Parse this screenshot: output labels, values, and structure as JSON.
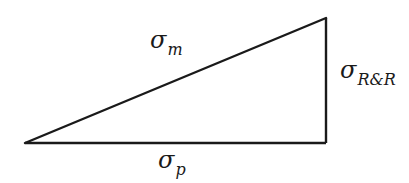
{
  "diagram": {
    "type": "right-triangle",
    "colors": {
      "stroke": "#1a1a1a",
      "background": "#ffffff"
    },
    "vertices": {
      "left": [
        25,
        143
      ],
      "top_right": [
        326,
        18
      ],
      "bottom_right": [
        326,
        143
      ]
    },
    "edges": [
      {
        "id": "hypotenuse",
        "label_symbol": "σ",
        "label_subscript": "m"
      },
      {
        "id": "vertical",
        "label_symbol": "σ",
        "label_subscript": "R&R"
      },
      {
        "id": "base",
        "label_symbol": "σ",
        "label_subscript": "p"
      }
    ]
  }
}
